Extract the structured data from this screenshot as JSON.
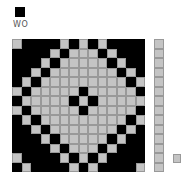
{
  "header": {
    "current_color": "#000000",
    "label": "WO"
  },
  "colors": {
    "black": "#000000",
    "gray": "#c4c4c4"
  },
  "grid": {
    "rows": 14,
    "cols": 14,
    "cells": [
      "GBBBBGBGBGBBBB",
      "BBBBGBGGGBGBBB",
      "BBBGBGGGGGBGBB",
      "BBGBGGGGGGGBGB",
      "BGBGGGGGGGGGBG",
      "GBGGGGGBGGGGGB",
      "BGGGGGBGBGGGGG",
      "GBGGGGGBGGGGGB",
      "BGBGGGGGGGGGBG",
      "BBGBGGGGGGGBGB",
      "BBBGBGGGGGBGBB",
      "BBBBGBGGGBGBBB",
      "GBBBBGBGBGBBBB",
      "BGBBBBGBGBBBBG"
    ]
  },
  "side_column": {
    "count": 14
  },
  "mini_square": {
    "color": "#c4c4c4"
  }
}
